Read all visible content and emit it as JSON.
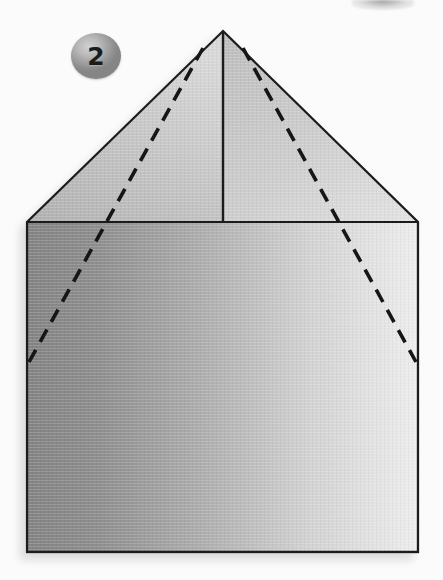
{
  "page": {
    "kind": "origami-fold-diagram",
    "width": 443,
    "height": 580,
    "background_color": "#fbfbfc"
  },
  "step": {
    "number": "2",
    "badge_shape": "circle",
    "badge_color": "#9d9d9d",
    "badge_text_color": "#1b1b1b"
  },
  "artifacts": {
    "corner_smudge": {
      "name": "scan-smudge",
      "color": "#505050"
    }
  },
  "figure": {
    "outline_color": "#1d1d1d",
    "outline_width": 2.2,
    "crease_color": "#111111",
    "crease_width": 3.4,
    "crease_dash": "13 9",
    "geometry": {
      "apex": [
        223,
        31
      ],
      "roof_left": [
        27,
        222
      ],
      "roof_right": [
        418,
        222
      ],
      "base_left": [
        27,
        552
      ],
      "base_right": [
        418,
        552
      ],
      "center_line_top": [
        223,
        31
      ],
      "center_line_bottom": [
        223,
        222
      ]
    },
    "faces": [
      {
        "name": "roof-left-face",
        "fill_from": "#b4b4b4",
        "fill_to": "#d6d6d6"
      },
      {
        "name": "roof-right-face",
        "fill_from": "#c2c2c2",
        "fill_to": "#e2e2e2"
      },
      {
        "name": "body-face",
        "fill_from": "#868686",
        "fill_to": "#ebebeb"
      }
    ],
    "fold_lines": [
      {
        "name": "fold-line-left",
        "style": "dashed",
        "from": [
          203,
          48
        ],
        "to": [
          29,
          362
        ]
      },
      {
        "name": "fold-line-right",
        "style": "dashed",
        "from": [
          243,
          48
        ],
        "to": [
          416,
          362
        ]
      }
    ],
    "solid_lines": [
      {
        "name": "center-crease-line",
        "style": "solid",
        "from": [
          223,
          31
        ],
        "to": [
          223,
          222
        ]
      },
      {
        "name": "roof-base-line",
        "style": "solid",
        "from": [
          27,
          222
        ],
        "to": [
          418,
          222
        ]
      }
    ]
  }
}
